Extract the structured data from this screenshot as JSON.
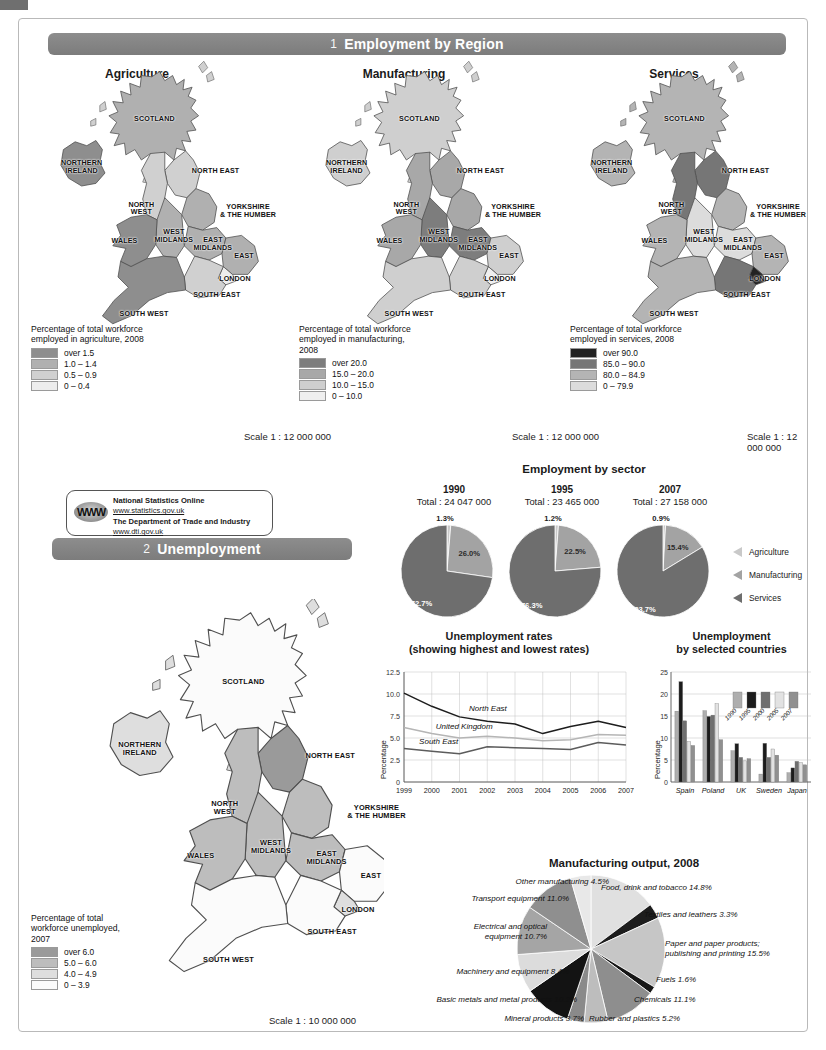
{
  "sections": {
    "one": {
      "number": "1",
      "title": "Employment by Region"
    },
    "two": {
      "number": "2",
      "title": "Unemployment"
    }
  },
  "maps": {
    "titles": [
      "Agriculture",
      "Manufacturing",
      "Services"
    ],
    "scale_top": "Scale 1 : 12 000 000",
    "scale_bottom": "Scale 1 : 10 000 000",
    "region_labels": [
      "SCOTLAND",
      "NORTHERN\nIRELAND",
      "NORTH EAST",
      "NORTH\nWEST",
      "YORKSHIRE\n& THE HUMBER",
      "EAST\nMIDLANDS",
      "WEST\nMIDLANDS",
      "WALES",
      "EAST",
      "LONDON",
      "SOUTH EAST",
      "SOUTH WEST"
    ],
    "legends": [
      {
        "caption": "Percentage of total workforce employed in agriculture, 2008",
        "items": [
          {
            "label": "over 1.5",
            "color": "#8e8e8e"
          },
          {
            "label": "1.0 – 1.4",
            "color": "#b0b0b0"
          },
          {
            "label": "0.5 – 0.9",
            "color": "#d0d0d0"
          },
          {
            "label": "0 – 0.4",
            "color": "#ededed"
          }
        ]
      },
      {
        "caption": "Percentage of total workforce employed in manufacturing, 2008",
        "items": [
          {
            "label": "over 20.0",
            "color": "#7d7d7d"
          },
          {
            "label": "15.0 – 20.0",
            "color": "#a8a8a8"
          },
          {
            "label": "10.0 – 15.0",
            "color": "#cfcfcf"
          },
          {
            "label": "0 – 10.0",
            "color": "#efefef"
          }
        ]
      },
      {
        "caption": "Percentage of total workforce employed in services, 2008",
        "items": [
          {
            "label": "over 90.0",
            "color": "#222222"
          },
          {
            "label": "85.0 – 90.0",
            "color": "#767676"
          },
          {
            "label": "80.0 – 84.9",
            "color": "#b4b4b4"
          },
          {
            "label": "0 – 79.9",
            "color": "#dcdcdc"
          }
        ]
      },
      {
        "caption": "Percentage of total workforce unemployed, 2007",
        "items": [
          {
            "label": "over 6.0",
            "color": "#9a9a9a"
          },
          {
            "label": "5.0 – 6.0",
            "color": "#bdbdbd"
          },
          {
            "label": "4.0 – 4.9",
            "color": "#dedede"
          },
          {
            "label": "0 – 3.9",
            "color": "#fbfbfb"
          }
        ]
      }
    ]
  },
  "source_box": {
    "icon": "www-globe-icon",
    "icon_text": "WWW",
    "line1": "National Statistics Online",
    "line2": "www.statistics.gov.uk",
    "line3": "The Department of Trade and Industry",
    "line4": "www.dti.gov.uk"
  },
  "chart_data": [
    {
      "id": "employment-by-sector",
      "type": "pie",
      "title": "Employment by sector",
      "legend": [
        "Agriculture",
        "Manufacturing",
        "Services"
      ],
      "legend_colors": [
        "#c9c9c9",
        "#a3a3a3",
        "#6e6e6e"
      ],
      "groups": [
        {
          "year": "1990",
          "total_label": "Total : 24 047 000",
          "categories": [
            "Agriculture",
            "Manufacturing",
            "Services"
          ],
          "values": [
            1.3,
            26.0,
            72.7
          ],
          "labels": [
            "1.3%",
            "26.0%",
            "72.7%"
          ]
        },
        {
          "year": "1995",
          "total_label": "Total : 23 465 000",
          "categories": [
            "Agriculture",
            "Manufacturing",
            "Services"
          ],
          "values": [
            1.2,
            22.5,
            76.3
          ],
          "labels": [
            "1.2%",
            "22.5%",
            "76.3%"
          ]
        },
        {
          "year": "2007",
          "total_label": "Total : 27 158 000",
          "categories": [
            "Agriculture",
            "Manufacturing",
            "Services"
          ],
          "values": [
            0.9,
            15.4,
            83.7
          ],
          "labels": [
            "0.9%",
            "15.4%",
            "83.7%"
          ]
        }
      ]
    },
    {
      "id": "unemployment-rates",
      "type": "line",
      "title": "Unemployment rates",
      "subtitle": "(showing highest and lowest rates)",
      "ylabel": "Percentage",
      "xlabel": "",
      "x": [
        "1999",
        "2000",
        "2001",
        "2002",
        "2003",
        "2004",
        "2005",
        "2006",
        "2007"
      ],
      "ylim": [
        0,
        12.5
      ],
      "yticks": [
        "0",
        "2.5",
        "5.0",
        "7.5",
        "10.0",
        "12.5"
      ],
      "grid": true,
      "series": [
        {
          "name": "North East",
          "values": [
            10.1,
            8.6,
            7.4,
            6.9,
            6.6,
            5.5,
            6.3,
            6.9,
            6.2
          ]
        },
        {
          "name": "United Kingdom",
          "values": [
            6.2,
            5.5,
            5.0,
            5.2,
            5.0,
            4.7,
            4.8,
            5.4,
            5.3
          ]
        },
        {
          "name": "South East",
          "values": [
            3.8,
            3.5,
            3.2,
            4.0,
            3.9,
            3.8,
            3.7,
            4.5,
            4.2
          ]
        }
      ]
    },
    {
      "id": "unemployment-by-country",
      "type": "bar",
      "title": "Unemployment",
      "subtitle": "by selected countries",
      "ylabel": "Percentage",
      "ylim": [
        0,
        25
      ],
      "yticks": [
        "0",
        "5",
        "10",
        "15",
        "20",
        "25"
      ],
      "categories": [
        "Spain",
        "Poland",
        "UK",
        "Sweden",
        "Japan"
      ],
      "legend": [
        "1990",
        "1995",
        "2000",
        "2005",
        "2007"
      ],
      "legend_colors": [
        "#aeaeae",
        "#1c1c1c",
        "#6f6f6f",
        "#e2e2e2",
        "#909090"
      ],
      "series": [
        {
          "name": "1990",
          "values": [
            16.1,
            16.2,
            7.1,
            1.8,
            2.1
          ]
        },
        {
          "name": "1995",
          "values": [
            22.8,
            14.9,
            8.7,
            8.8,
            3.2
          ]
        },
        {
          "name": "2000",
          "values": [
            13.9,
            15.2,
            5.6,
            5.6,
            4.7
          ]
        },
        {
          "name": "2005",
          "values": [
            9.2,
            17.8,
            4.8,
            7.5,
            4.4
          ]
        },
        {
          "name": "2007",
          "values": [
            8.3,
            9.6,
            5.3,
            6.1,
            3.9
          ]
        }
      ]
    },
    {
      "id": "manufacturing-output",
      "type": "pie",
      "title": "Manufacturing output, 2008",
      "categories": [
        "Food, drink and tobacco",
        "Textiles and leathers",
        "Paper and paper products; publishing and printing",
        "Fuels",
        "Chemicals",
        "Rubber and plastics",
        "Mineral products",
        "Basic metals and metal products",
        "Machinery and equipment",
        "Electrical and optical equipment",
        "Transport equipment",
        "Other manufacturing"
      ],
      "values": [
        14.8,
        3.3,
        15.5,
        1.6,
        11.1,
        5.2,
        3.7,
        10.2,
        8.4,
        10.7,
        11.0,
        4.5
      ],
      "labels": [
        "Food, drink and tobacco 14.8%",
        "Textiles and leathers 3.3%",
        "Paper and paper products;\npublishing and printing 15.5%",
        "Fuels 1.6%",
        "Chemicals 11.1%",
        "Rubber and plastics 5.2%",
        "Mineral products 3.7%",
        "Basic metals and metal products 10.2%",
        "Machinery and equipment 8.4%",
        "Electrical and optical\nequipment 10.7%",
        "Transport equipment 11.0%",
        "Other manufacturing 4.5%"
      ],
      "colors": [
        "#e0e0e0",
        "#1d1d1d",
        "#c6c6c6",
        "#171717",
        "#8e8e8e",
        "#bdbdbd",
        "#8a8a8a",
        "#131313",
        "#dcdcdc",
        "#a5a5a5",
        "#8f8f8f",
        "#e8e8e8"
      ]
    }
  ],
  "colors": {
    "banner": "#7c7c7c",
    "map_outline": "#5a5a5a",
    "grid": "#b3b3b3"
  }
}
